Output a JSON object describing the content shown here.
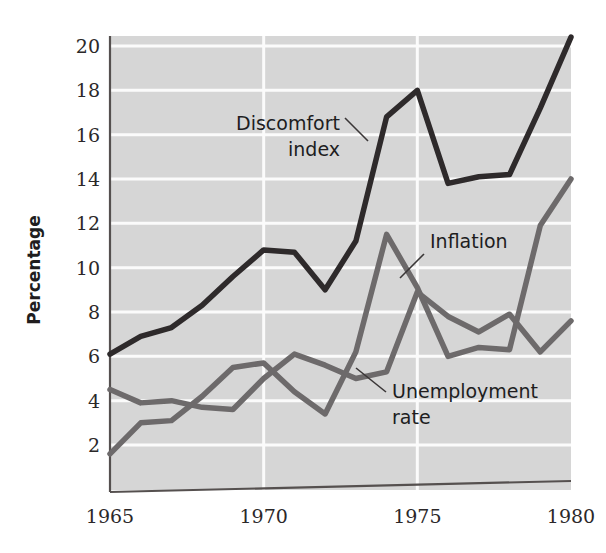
{
  "chart_data": {
    "type": "line",
    "title": "",
    "xlabel": "",
    "ylabel": "Percentage",
    "xlim": [
      1965,
      1980
    ],
    "ylim": [
      1.2,
      20.6
    ],
    "xticks": [
      1965,
      1970,
      1975,
      1980
    ],
    "yticks": [
      2,
      4,
      6,
      8,
      10,
      12,
      14,
      16,
      18,
      20
    ],
    "grid": "horizontal and vertical white gridlines on gray panel",
    "legend": "none (inline annotations)",
    "x": [
      1965,
      1966,
      1967,
      1968,
      1969,
      1970,
      1971,
      1972,
      1973,
      1974,
      1975,
      1976,
      1977,
      1978,
      1979,
      1980
    ],
    "series": [
      {
        "name": "Discomfort index",
        "color": "#2e2a2b",
        "width": 5.5,
        "values": [
          6.1,
          6.9,
          7.3,
          8.3,
          9.6,
          10.8,
          10.7,
          9.0,
          11.2,
          16.8,
          18.0,
          13.8,
          14.1,
          14.2,
          17.2,
          20.4
        ]
      },
      {
        "name": "Inflation",
        "color": "#6d6a6b",
        "width": 5.5,
        "values": [
          1.6,
          3.0,
          3.1,
          4.2,
          5.5,
          5.7,
          4.4,
          3.4,
          6.2,
          11.5,
          9.1,
          6.0,
          6.4,
          6.3,
          11.9,
          14.0
        ]
      },
      {
        "name": "Unemployment rate",
        "color": "#6d6a6b",
        "width": 5.5,
        "values": [
          4.5,
          3.9,
          4.0,
          3.7,
          3.6,
          5.0,
          6.1,
          5.6,
          5.0,
          5.3,
          8.9,
          7.8,
          7.1,
          7.9,
          6.2,
          7.6
        ]
      }
    ],
    "annotations": [
      {
        "label_line1": "Discomfort",
        "label_line2": "index",
        "series": "Discomfort index",
        "leader": "from text right edge up-right to the 1973-1974 segment"
      },
      {
        "label_line1": "Inflation",
        "label_line2": "",
        "series": "Inflation",
        "leader": "from text left edge down-left to the 1974 peak"
      },
      {
        "label_line1": "Unemployment",
        "label_line2": "rate",
        "series": "Unemployment rate",
        "leader": "from text left edge up-left to the 1973-1974 segment"
      }
    ]
  },
  "axis": {
    "ylabel": "Percentage",
    "yticklabels": [
      "20",
      "18",
      "16",
      "14",
      "12",
      "10",
      "8",
      "6",
      "4",
      "2"
    ],
    "xticklabels": [
      "1965",
      "1970",
      "1975",
      "1980"
    ]
  },
  "style": {
    "panel_bg": "#d6d6d6",
    "gridline": "#fbfbfb",
    "axis_line": "#55504f",
    "dark_series": "#2e2a2b",
    "gray_series": "#6d6a6b",
    "page_bg": "#ffffff",
    "text": "#231f20"
  }
}
